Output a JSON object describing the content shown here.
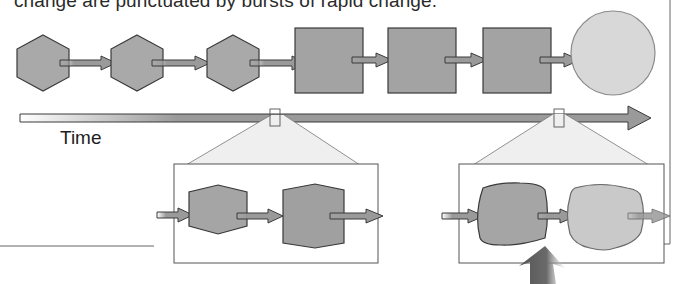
{
  "caption": "change are punctuated by bursts of rapid change.",
  "timeline": {
    "label": "Time",
    "stages": [
      {
        "shape": "hexagon",
        "fill": "#a9a9a9"
      },
      {
        "shape": "hexagon",
        "fill": "#a9a9a9"
      },
      {
        "shape": "hexagon",
        "fill": "#a9a9a9"
      },
      {
        "shape": "square",
        "fill": "#a3a3a3"
      },
      {
        "shape": "square",
        "fill": "#a3a3a3"
      },
      {
        "shape": "square",
        "fill": "#a3a3a3"
      },
      {
        "shape": "circle",
        "fill": "#d6d6d6"
      }
    ]
  },
  "zoom_panels": [
    {
      "name": "gradual-change-detail",
      "shapes": [
        "hexagon",
        "irregular-octagon"
      ]
    },
    {
      "name": "rapid-change-detail",
      "shapes": [
        "rounded-square",
        "rounded-blob"
      ]
    }
  ],
  "colors": {
    "shape_dark": "#a3a3a3",
    "shape_light": "#d6d6d6",
    "stroke": "#3a3a3a",
    "arrow_fill": "#9a9a9a",
    "callout_fill": "#ececec",
    "frame_line": "#555555"
  }
}
